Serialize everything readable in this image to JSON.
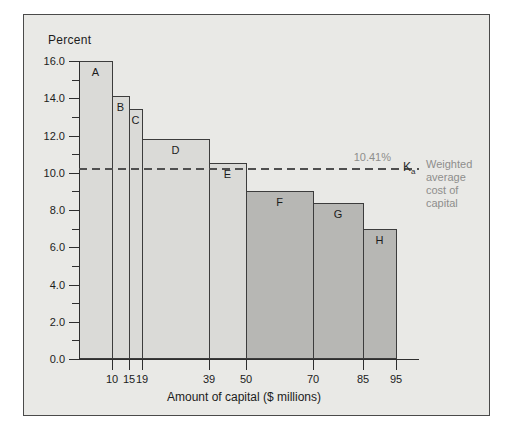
{
  "chart_data": {
    "type": "bar",
    "title": "",
    "xlabel": "Amount of capital ($ millions)",
    "ylabel": "Percent",
    "xlim": [
      0,
      95
    ],
    "ylim": [
      0,
      16
    ],
    "x_ticks": [
      10,
      15,
      19,
      39,
      50,
      70,
      85,
      95
    ],
    "y_ticks_major": [
      0,
      2,
      4,
      6,
      8,
      10,
      12,
      14,
      16
    ],
    "y_ticks_minor": [
      1,
      3,
      5,
      7,
      9,
      11,
      13,
      15
    ],
    "grid": "off",
    "bars": [
      {
        "label": "A",
        "x_start": 0,
        "x_end": 10,
        "value": 16.0,
        "group": "light"
      },
      {
        "label": "B",
        "x_start": 10,
        "x_end": 15,
        "value": 14.1,
        "group": "light"
      },
      {
        "label": "C",
        "x_start": 15,
        "x_end": 19,
        "value": 13.4,
        "group": "light"
      },
      {
        "label": "D",
        "x_start": 19,
        "x_end": 39,
        "value": 11.8,
        "group": "light"
      },
      {
        "label": "E",
        "x_start": 39,
        "x_end": 50,
        "value": 10.5,
        "group": "light"
      },
      {
        "label": "F",
        "x_start": 50,
        "x_end": 70,
        "value": 9.0,
        "group": "dark"
      },
      {
        "label": "G",
        "x_start": 70,
        "x_end": 85,
        "value": 8.4,
        "group": "dark"
      },
      {
        "label": "H",
        "x_start": 85,
        "x_end": 95,
        "value": 7.0,
        "group": "dark"
      }
    ],
    "reference_line": {
      "value": 10.41,
      "label": "10.41%",
      "symbol_main": "K",
      "symbol_sub": "a",
      "caption_lines": [
        "Weighted",
        "average",
        "cost of",
        "capital"
      ],
      "style": "dashed"
    },
    "colors": {
      "figure_background": "#e9e9e6",
      "frame_border": "#4a4a4a",
      "light_bar": "#dadad7",
      "dark_bar": "#b7b7b4",
      "bar_border": "#3c3c3c",
      "axis": "#2e2e2e",
      "dashed_line": "#4f4f4f",
      "gray_text": "#8e8e8c",
      "dark_text": "#1c1c1c"
    }
  }
}
